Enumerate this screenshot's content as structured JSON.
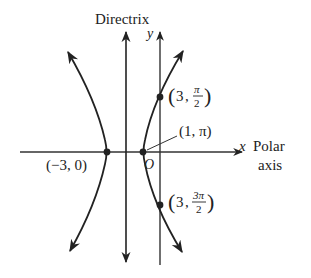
{
  "diagram": {
    "title_label": "Directrix",
    "y_axis_label": "y",
    "x_axis_label": "x",
    "polar_axis_label_line1": "Polar",
    "polar_axis_label_line2": "axis",
    "origin_label": "O",
    "points": [
      {
        "label": "(-3, 0)",
        "display": "(−3, 0)"
      },
      {
        "label": "(1, π)",
        "display": "(1, π)"
      },
      {
        "label": "(3, π/2)",
        "r": "3",
        "theta_num": "π",
        "theta_den": "2"
      },
      {
        "label": "(3, 3π/2)",
        "r": "3",
        "theta_num": "3π",
        "theta_den": "2"
      }
    ],
    "colors": {
      "curve": "#222222",
      "background": "#ffffff"
    }
  }
}
